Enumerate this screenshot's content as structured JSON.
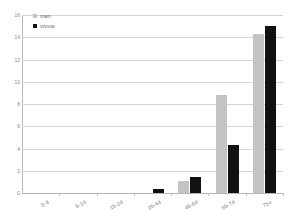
{
  "chart_data": {
    "type": "bar",
    "title": "",
    "subtitle": "",
    "xlabel": "",
    "ylabel": "",
    "categories": [
      "0-4",
      "5-14",
      "15-24",
      "25-44",
      "45-64",
      "65-74",
      "75+"
    ],
    "series": [
      {
        "name": "man",
        "color": "#c4c4c4",
        "values": [
          0,
          0,
          0,
          0,
          1.1,
          8.8,
          14.3
        ]
      },
      {
        "name": "vrouw",
        "color": "#111111",
        "values": [
          0,
          0,
          0,
          0.4,
          1.4,
          4.3,
          15.0
        ]
      }
    ],
    "ylim": [
      0,
      16
    ],
    "yticks": [
      0,
      2,
      4,
      6,
      8,
      10,
      12,
      14,
      16
    ],
    "ytick_labels": [
      "0",
      "2",
      "4",
      "6",
      "8",
      "10",
      "12",
      "14",
      "16"
    ],
    "grid": "horizontal",
    "legend_position": "top-left-inside",
    "background": "#ffffff",
    "gridline_color": "#d4d4d4",
    "axis_color": "#b9b9b9",
    "tick_label_color": "#8a8a8a"
  },
  "legend": {
    "items": [
      {
        "label": "man"
      },
      {
        "label": "vrouw"
      }
    ]
  }
}
